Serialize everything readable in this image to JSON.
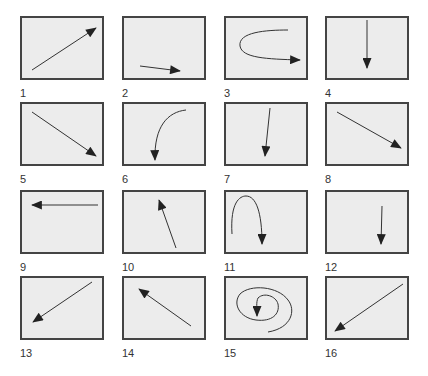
{
  "colors": {
    "panel_bg": "#ececec",
    "border": "#444444",
    "arrow": "#222222"
  },
  "panels": [
    {
      "label": "1",
      "icon": "arrow-up-right-icon"
    },
    {
      "label": "2",
      "icon": "arrow-right-short-icon"
    },
    {
      "label": "3",
      "icon": "arrow-u-turn-right-icon"
    },
    {
      "label": "4",
      "icon": "arrow-down-icon"
    },
    {
      "label": "5",
      "icon": "arrow-down-right-icon"
    },
    {
      "label": "6",
      "icon": "arrow-curve-down-icon"
    },
    {
      "label": "7",
      "icon": "arrow-down-slight-left-icon"
    },
    {
      "label": "8",
      "icon": "arrow-down-right-icon"
    },
    {
      "label": "9",
      "icon": "arrow-left-icon"
    },
    {
      "label": "10",
      "icon": "arrow-up-left-short-icon"
    },
    {
      "label": "11",
      "icon": "arrow-arch-down-icon"
    },
    {
      "label": "12",
      "icon": "arrow-down-short-icon"
    },
    {
      "label": "13",
      "icon": "arrow-down-left-icon"
    },
    {
      "label": "14",
      "icon": "arrow-up-left-icon"
    },
    {
      "label": "15",
      "icon": "arrow-spiral-icon"
    },
    {
      "label": "16",
      "icon": "arrow-down-left-long-icon"
    }
  ]
}
